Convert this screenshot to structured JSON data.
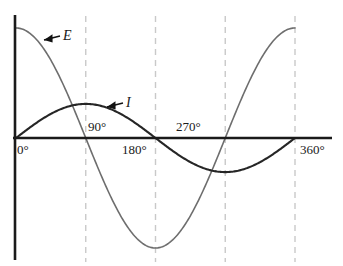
{
  "chart_data": {
    "type": "line",
    "title": "",
    "subtitle": "",
    "xlabel": "",
    "ylabel": "",
    "xlim": [
      0,
      360
    ],
    "ylim": [
      -1.05,
      1.05
    ],
    "grid": "vertical-dashed",
    "legend_position": "inline-annotations",
    "x_tick_labels": [
      "0°",
      "90°",
      "180°",
      "270°",
      "360°"
    ],
    "x_tick_values": [
      0,
      90,
      180,
      270,
      360
    ],
    "gridline_degrees": [
      90,
      180,
      270,
      360
    ],
    "series": [
      {
        "name": "E",
        "label": "E",
        "color": "#6e6e6e",
        "width": 1.6,
        "function": "cosine",
        "amplitude": 1.0,
        "phase_deg": 0,
        "x": [
          0,
          15,
          30,
          45,
          60,
          75,
          90,
          105,
          120,
          135,
          150,
          165,
          180,
          195,
          210,
          225,
          240,
          255,
          270,
          285,
          300,
          315,
          330,
          345,
          360
        ],
        "values": [
          1.0,
          0.966,
          0.866,
          0.707,
          0.5,
          0.259,
          0.0,
          -0.259,
          -0.5,
          -0.707,
          -0.866,
          -0.966,
          -1.0,
          -0.966,
          -0.866,
          -0.707,
          -0.5,
          -0.259,
          0.0,
          0.259,
          0.5,
          0.707,
          0.866,
          0.966,
          1.0
        ]
      },
      {
        "name": "I",
        "label": "I",
        "color": "#262626",
        "width": 2.1,
        "function": "sine",
        "amplitude": 0.31,
        "phase_deg": 0,
        "x": [
          0,
          15,
          30,
          45,
          60,
          75,
          90,
          105,
          120,
          135,
          150,
          165,
          180,
          195,
          210,
          225,
          240,
          255,
          270,
          285,
          300,
          315,
          330,
          345,
          360
        ],
        "values": [
          0.0,
          0.08,
          0.155,
          0.219,
          0.268,
          0.299,
          0.31,
          0.299,
          0.268,
          0.219,
          0.155,
          0.08,
          0.0,
          -0.08,
          -0.155,
          -0.219,
          -0.268,
          -0.299,
          -0.31,
          -0.299,
          -0.268,
          -0.219,
          -0.155,
          -0.08,
          0.0
        ]
      }
    ],
    "annotations": [
      {
        "text": "E",
        "target_deg": 36,
        "arrow": "left"
      },
      {
        "text": "I",
        "target_deg": 112,
        "arrow": "left"
      }
    ]
  },
  "axes": {
    "x_axis_color": "#1a1a1a",
    "y_axis_color": "#1a1a1a",
    "gridline_color": "#c9c9c9"
  },
  "labels": {
    "deg_0": "0°",
    "deg_90": "90°",
    "deg_180": "180°",
    "deg_270": "270°",
    "deg_360": "360°",
    "series_e": "E",
    "series_i": "I"
  }
}
